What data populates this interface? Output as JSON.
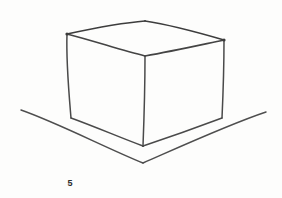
{
  "figure": {
    "caption": "5",
    "medium": "pencil-drawing",
    "background_color": "#fdfdfc",
    "stroke_color": "#4a4a4a",
    "stroke_color_dark": "#3a3a3a",
    "caption_color": "#2c2c2c",
    "canvas": {
      "width": 282,
      "height": 198
    }
  },
  "drawing": {
    "cube": {
      "name": "cube",
      "vertices": {
        "top_back": {
          "x": 145,
          "y": 21
        },
        "top_left": {
          "x": 67,
          "y": 34
        },
        "top_right": {
          "x": 224,
          "y": 40
        },
        "top_front": {
          "x": 145,
          "y": 56
        },
        "bottom_left": {
          "x": 71,
          "y": 118
        },
        "bottom_right": {
          "x": 222,
          "y": 118
        },
        "bottom_front": {
          "x": 143,
          "y": 146
        }
      },
      "edges": [
        {
          "name": "top-back-left-edge",
          "d": "M 67 34 C 95 28, 120 23, 145 21"
        },
        {
          "name": "top-back-right-edge",
          "d": "M 145 21 C 172 25, 200 33, 224 40"
        },
        {
          "name": "top-front-left-edge",
          "d": "M 67 34 C 94 41, 121 50, 145 56"
        },
        {
          "name": "top-front-right-edge",
          "d": "M 145 56 C 173 51, 200 45, 224 40"
        },
        {
          "name": "left-vertical-edge",
          "d": "M 67 34 C 66 62, 69 94, 71 118"
        },
        {
          "name": "right-vertical-edge",
          "d": "M 224 40 C 224 66, 223 96, 222 118"
        },
        {
          "name": "front-vertical-edge",
          "d": "M 145 56 C 145 86, 144 120, 143 146"
        },
        {
          "name": "bottom-left-edge",
          "d": "M 71 118 C 96 127, 121 138, 143 146"
        },
        {
          "name": "bottom-right-edge",
          "d": "M 143 146 C 170 137, 198 127, 222 118"
        }
      ]
    },
    "ground_plane": {
      "name": "ground-plane-corner",
      "lines": [
        {
          "name": "ground-line-left",
          "d": "M 21 110 C 58 123, 104 147, 143 163"
        },
        {
          "name": "ground-line-right",
          "d": "M 143 163 C 184 145, 230 124, 266 112"
        }
      ]
    }
  }
}
